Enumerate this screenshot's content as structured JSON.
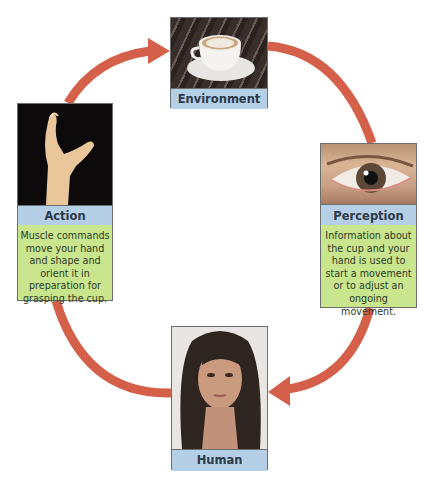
{
  "diagram": {
    "type": "cycle",
    "arrow_color": "#d5604a",
    "nodes": [
      {
        "id": "environment",
        "label": "Environment",
        "image": "coffee-cup-on-table"
      },
      {
        "id": "perception",
        "label": "Perception",
        "image": "human-eye",
        "description": "Information about the cup and your hand is used to start a movement or to adjust an ongoing movement."
      },
      {
        "id": "human",
        "label": "Human",
        "image": "woman-portrait"
      },
      {
        "id": "action",
        "label": "Action",
        "image": "reaching-hand",
        "description": "Muscle commands move your hand and shape and orient it in preparation for grasping the cup."
      }
    ],
    "edges": [
      {
        "from": "action",
        "to": "environment"
      },
      {
        "from": "environment",
        "to": "perception"
      },
      {
        "from": "perception",
        "to": "human"
      },
      {
        "from": "human",
        "to": "action"
      }
    ]
  },
  "colors": {
    "label_band": "#b4cfe6",
    "description_box": "#c9e58d",
    "border": "#6b6f6f"
  }
}
